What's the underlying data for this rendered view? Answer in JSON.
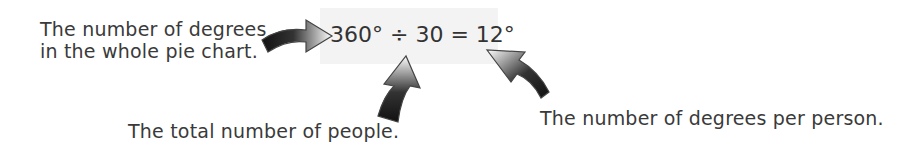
{
  "annotations": {
    "whole_pie": {
      "line1": "The number of degrees",
      "line2": "in the whole pie chart."
    },
    "total_people": "The total number of people.",
    "degrees_per_person": "The number of degrees per person."
  },
  "equation": {
    "text": "360° ÷ 30 = 12°",
    "dividend": "360°",
    "operator": "÷",
    "divisor": "30",
    "result": "12°"
  },
  "colors": {
    "text": "#3a3a3a",
    "equation_background": "#f3f3f3",
    "arrow_dark": "#111111",
    "arrow_light": "#ffffff"
  }
}
